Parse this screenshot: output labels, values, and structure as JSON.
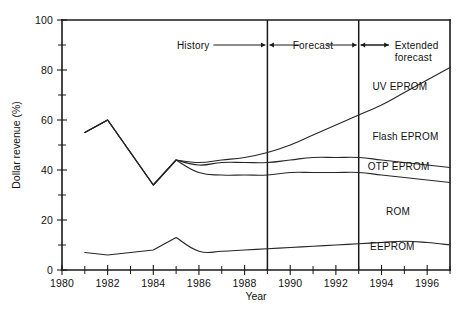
{
  "chart_data": {
    "type": "area",
    "title": "",
    "xlabel": "Year",
    "ylabel": "Dollar revenue (%)",
    "xlim": [
      1980,
      1997
    ],
    "ylim": [
      0,
      100
    ],
    "grid": false,
    "legend_position": "inline-labels",
    "x_ticks_major": [
      1980,
      1982,
      1984,
      1986,
      1988,
      1990,
      1992,
      1994,
      1996
    ],
    "x_tick_labels": [
      "1980",
      "1982",
      "1984",
      "1986",
      "1988",
      "1990",
      "1992",
      "1994",
      "1996"
    ],
    "x_ticks_minor": [
      1981,
      1983,
      1985,
      1987,
      1989,
      1991,
      1993,
      1995,
      1997
    ],
    "y_ticks_major": [
      0,
      20,
      40,
      60,
      80,
      100
    ],
    "y_tick_labels": [
      "0",
      "20",
      "40",
      "60",
      "80",
      "100"
    ],
    "y_ticks_minor": [
      10,
      30,
      50,
      70,
      90
    ],
    "x": [
      1981,
      1982,
      1983,
      1984,
      1985,
      1986,
      1987,
      1988,
      1989,
      1990,
      1991,
      1992,
      1993,
      1994,
      1995,
      1996,
      1997
    ],
    "boundaries": [
      {
        "name": "UV EPROM upper boundary",
        "description": "Top cumulative boundary separating UV EPROM from region above; historical data then forecast decline to 1985 then flat",
        "values": [
          55,
          60,
          47,
          34,
          44,
          42,
          43,
          43,
          43,
          44,
          45,
          45,
          45,
          44,
          43,
          42,
          41
        ]
      },
      {
        "name": "Flash EPROM boundary",
        "description": "Rising curve that splits from the UV EPROM boundary at 1985 and climbs steeply through the extended forecast",
        "values": [
          55,
          60,
          47,
          34,
          44,
          43,
          44,
          45,
          47,
          50,
          54,
          58,
          62,
          66,
          71,
          76,
          81
        ]
      },
      {
        "name": "OTP EPROM boundary",
        "description": "Lower branch splitting at 1985, dipping then flattening near 38 and drifting down",
        "values": [
          55,
          60,
          47,
          34,
          44,
          39,
          38,
          38,
          38,
          39,
          39,
          39,
          39,
          38,
          37,
          36,
          35
        ]
      },
      {
        "name": "EEPROM / ROM boundary",
        "description": "Bottom boundary between EEPROM and ROM bands",
        "values": [
          7,
          6,
          7,
          8,
          13,
          7.5,
          7.5,
          8,
          8.5,
          9,
          9.5,
          10,
          10.5,
          11,
          11.5,
          11,
          10
        ]
      }
    ],
    "series_labels": [
      {
        "text": "UV EPROM",
        "x": 1993.6,
        "y": 72
      },
      {
        "text": "Flash EPROM",
        "x": 1993.6,
        "y": 52
      },
      {
        "text": "OTP EPROM",
        "x": 1993.4,
        "y": 40
      },
      {
        "text": "ROM",
        "x": 1994.2,
        "y": 22
      },
      {
        "text": "EEPROM",
        "x": 1993.5,
        "y": 8
      }
    ],
    "phase_dividers": [
      1989,
      1993
    ],
    "phase_annotations": [
      {
        "text": "History",
        "lines": [
          "History"
        ]
      },
      {
        "text": "Forecast",
        "lines": [
          "Forecast"
        ]
      },
      {
        "text": "Extended forecast",
        "lines": [
          "Extended",
          "forecast"
        ]
      }
    ],
    "colors": {
      "line": "#262626",
      "axis": "#1a1a1a",
      "text": "#111111",
      "background": "#ffffff"
    }
  }
}
